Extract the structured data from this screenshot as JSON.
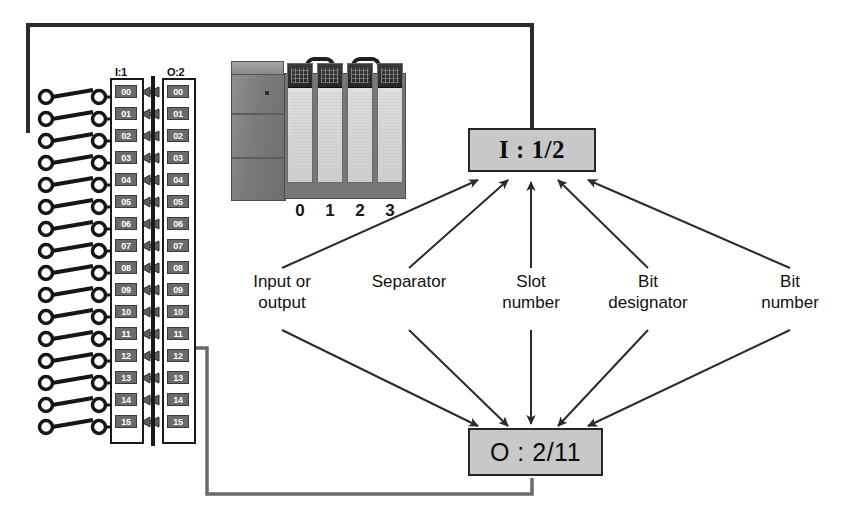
{
  "figure": {
    "kind": "plc-addressing-diagram",
    "caption": ""
  },
  "input_strip": {
    "header": "I:1",
    "name": "input-module-terminal-strip",
    "terminals": [
      "00",
      "01",
      "02",
      "03",
      "04",
      "05",
      "06",
      "07",
      "08",
      "09",
      "10",
      "11",
      "12",
      "13",
      "14",
      "15"
    ],
    "wired_terminal": "02"
  },
  "output_strip": {
    "header": "O:2",
    "name": "output-module-terminal-strip",
    "terminals": [
      "00",
      "01",
      "02",
      "03",
      "04",
      "05",
      "06",
      "07",
      "08",
      "09",
      "10",
      "11",
      "12",
      "13",
      "14",
      "15"
    ],
    "wired_terminal": "11"
  },
  "plc": {
    "name": "plc-chassis-photo",
    "power_supply_label": "",
    "slot_numbers": [
      "0",
      "1",
      "2",
      "3"
    ]
  },
  "address_input": {
    "name": "input-address-box",
    "text": "I : 1/2",
    "fill": "#c8c8c8",
    "border": "#262626"
  },
  "address_output": {
    "name": "output-address-box",
    "text": "O : 2/11",
    "fill": "#c8c8c8",
    "border": "#262626"
  },
  "callouts": [
    {
      "id": "input-or-output",
      "text": "Input or\noutput"
    },
    {
      "id": "separator",
      "text": "Separator"
    },
    {
      "id": "slot-number",
      "text": "Slot\nnumber"
    },
    {
      "id": "bit-designator",
      "text": "Bit\ndesignator"
    },
    {
      "id": "bit-number",
      "text": "Bit\nnumber"
    }
  ],
  "colors": {
    "line": "#2b2b2b",
    "chip_fill": "#6b6b6b",
    "chip_text": "#ffffff",
    "box_fill": "#c8c8c8",
    "wire": "#3c3c3c"
  }
}
